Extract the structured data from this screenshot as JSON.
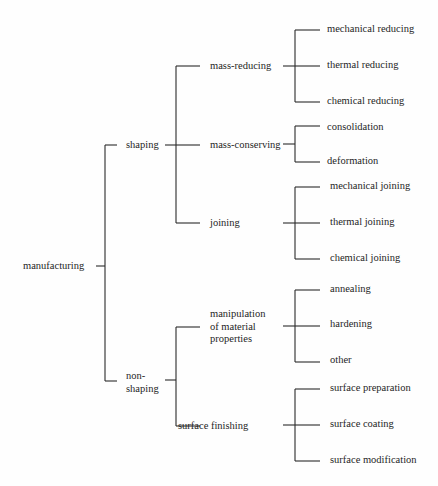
{
  "diagram": {
    "line_color": "#2a2a2a",
    "root": {
      "label": "manufacturing",
      "children": [
        {
          "label": "shaping",
          "children": [
            {
              "label": "mass-reducing",
              "children": [
                {
                  "label": "mechanical reducing"
                },
                {
                  "label": "thermal reducing"
                },
                {
                  "label": "chemical reducing"
                }
              ]
            },
            {
              "label": "mass-conserving",
              "children": [
                {
                  "label": "consolidation"
                },
                {
                  "label": "deformation"
                }
              ]
            },
            {
              "label": "joining",
              "children": [
                {
                  "label": "mechanical joining"
                },
                {
                  "label": "thermal joining"
                },
                {
                  "label": "chemical joining"
                }
              ]
            }
          ]
        },
        {
          "label": "non-shaping",
          "label_lines": [
            "non-",
            "shaping"
          ],
          "children": [
            {
              "label": "manipulation of material properties",
              "label_lines": [
                "manipulation",
                "of material",
                "properties"
              ],
              "children": [
                {
                  "label": "annealing"
                },
                {
                  "label": "hardening"
                },
                {
                  "label": "other"
                }
              ]
            },
            {
              "label": "surface finishing",
              "children": [
                {
                  "label": "surface preparation"
                },
                {
                  "label": "surface coating"
                },
                {
                  "label": "surface modification"
                }
              ]
            }
          ]
        }
      ]
    }
  }
}
